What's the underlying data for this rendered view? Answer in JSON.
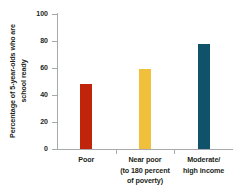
{
  "chart_data": {
    "type": "bar",
    "title": "",
    "subtitle": "",
    "xlabel": "",
    "ylabel": "Percentage of 5-year-olds who are school ready",
    "ylabel_lines": [
      "Percentage of 5-year-olds who are",
      "school ready"
    ],
    "categories": [
      "Poor",
      "Near poor (to 180 percent of poverty)",
      "Moderate/ high income"
    ],
    "category_lines": [
      [
        "Poor"
      ],
      [
        "Near poor",
        "(to 180 percent",
        "of poverty)"
      ],
      [
        "Moderate/",
        "high income"
      ]
    ],
    "values": [
      48,
      59,
      78
    ],
    "ylim": [
      0,
      100
    ],
    "yticks": [
      0,
      20,
      40,
      60,
      80,
      100
    ],
    "ytick_labels": [
      "0",
      "20",
      "40",
      "60",
      "80",
      "100"
    ],
    "grid": false,
    "legend": false,
    "legend_position": "none",
    "bar_colors": [
      "#C0240B",
      "#F0C03C",
      "#11526B"
    ],
    "axis_color": "#a7a9ac",
    "text_color": "#231f20",
    "background": "#ffffff"
  }
}
